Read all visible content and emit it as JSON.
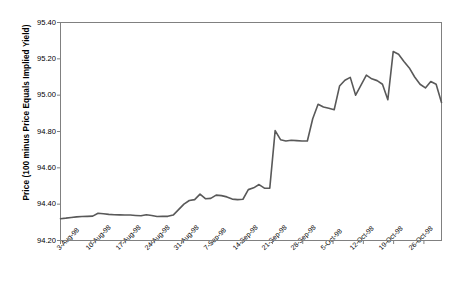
{
  "chart_data": {
    "type": "line",
    "title": "",
    "subtitle": "",
    "xlabel": "",
    "ylabel": "Price (100 minus Price Equals Implied Yield)",
    "ylim": [
      94.2,
      95.4
    ],
    "ytick_labels": [
      "95.40",
      "95.20",
      "95.00",
      "94.80",
      "94.60",
      "94.40",
      "94.20"
    ],
    "ytick_values": [
      95.4,
      95.2,
      95.0,
      94.8,
      94.6,
      94.4,
      94.2
    ],
    "xtick_labels": [
      "3-Aug-98",
      "10-Aug-98",
      "17-Aug-98",
      "24-Aug-98",
      "31-Aug-98",
      "7-Sep-98",
      "14-Sep-98",
      "21-Sep-98",
      "28-Sep-98",
      "5-Oct-98",
      "12-Oct-98",
      "19-Oct-98",
      "26-Oct-98"
    ],
    "grid": false,
    "legend": false,
    "legend_position": "none",
    "line_color": "#595959",
    "line_width": 1.6,
    "axis_color": "#808080",
    "background": "#ffffff",
    "series": [
      {
        "name": "Price",
        "x": [
          0,
          1,
          2,
          3,
          4,
          5,
          6,
          7,
          8,
          9,
          10,
          11,
          12,
          13,
          14,
          15,
          16,
          17,
          18,
          19,
          20,
          21,
          22,
          23,
          24,
          25,
          26,
          27,
          28,
          29,
          30,
          31,
          32,
          33,
          34,
          35,
          36,
          37,
          38,
          39,
          40,
          41,
          42,
          43,
          44,
          45,
          46,
          47,
          48,
          49,
          50,
          51,
          52,
          53,
          54,
          55,
          56,
          57,
          58,
          59,
          60,
          61,
          62,
          63,
          64,
          65
        ],
        "values": [
          94.32,
          94.323,
          94.327,
          94.33,
          94.332,
          94.333,
          94.334,
          94.35,
          94.347,
          94.344,
          94.342,
          94.341,
          94.34,
          94.34,
          94.338,
          94.336,
          94.342,
          94.338,
          94.332,
          94.333,
          94.333,
          94.34,
          94.37,
          94.4,
          94.42,
          94.425,
          94.455,
          94.43,
          94.432,
          94.45,
          94.447,
          94.44,
          94.428,
          94.425,
          94.427,
          94.48,
          94.49,
          94.508,
          94.488,
          94.488,
          94.805,
          94.755,
          94.748,
          94.752,
          94.75,
          94.748,
          94.748,
          94.87,
          94.95,
          94.935,
          94.928,
          94.92,
          95.05,
          95.082,
          95.098,
          95.0,
          95.055,
          95.11,
          95.09,
          95.08,
          95.06,
          94.975,
          95.24,
          95.225,
          95.185,
          95.15
        ],
        "values_tail": [
          95.1,
          95.06,
          95.04,
          95.075,
          95.06,
          94.96
        ]
      }
    ],
    "series_full": [
      94.32,
      94.323,
      94.327,
      94.33,
      94.332,
      94.333,
      94.334,
      94.35,
      94.347,
      94.344,
      94.342,
      94.341,
      94.34,
      94.34,
      94.338,
      94.336,
      94.342,
      94.338,
      94.332,
      94.333,
      94.333,
      94.34,
      94.37,
      94.4,
      94.42,
      94.425,
      94.455,
      94.43,
      94.432,
      94.45,
      94.447,
      94.44,
      94.428,
      94.425,
      94.427,
      94.48,
      94.49,
      94.508,
      94.488,
      94.488,
      94.805,
      94.755,
      94.748,
      94.752,
      94.75,
      94.748,
      94.748,
      94.87,
      94.95,
      94.935,
      94.928,
      94.92,
      95.05,
      95.082,
      95.098,
      95.0,
      95.055,
      95.11,
      95.09,
      95.08,
      95.06,
      94.975,
      95.24,
      95.225,
      95.185,
      95.15,
      95.1,
      95.06,
      95.04,
      95.075,
      95.06,
      94.96
    ]
  }
}
